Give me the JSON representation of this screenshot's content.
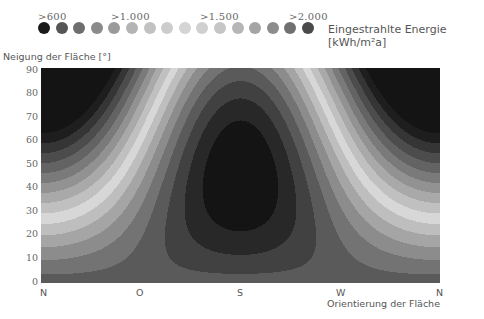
{
  "chart_data": {
    "type": "heatmap",
    "subtype": "filled-contour",
    "title": "",
    "legend": {
      "title": "Eingestrahlte Energie [kWh/m²a]",
      "tick_labels": [
        ">600",
        ">1.000",
        ">1.500",
        ">2.000"
      ],
      "swatch_colors": [
        "#1a1a1a",
        "#555555",
        "#6e6e6e",
        "#8a8a8a",
        "#9a9a9a",
        "#b4b4b4",
        "#c2c2c2",
        "#cccccc",
        "#d4d4d4",
        "#d0d0d0",
        "#c6c6c6",
        "#b6b6b6",
        "#a4a4a4",
        "#8c8c8c",
        "#707070",
        "#4a4a4a"
      ],
      "value_steps": [
        600,
        700,
        800,
        900,
        1000,
        1100,
        1200,
        1300,
        1400,
        1500,
        1600,
        1700,
        1800,
        1900,
        2000,
        2100
      ]
    },
    "xlabel": "Orientierung der Fläche",
    "ylabel": "Neigung der Fläche [°]",
    "x_ticks": [
      "N",
      "O",
      "S",
      "W",
      "N"
    ],
    "x_tick_azimuth_deg": [
      0,
      90,
      180,
      270,
      360
    ],
    "y_ticks": [
      0,
      10,
      20,
      30,
      40,
      50,
      60,
      70,
      80,
      90
    ],
    "ylim": [
      0,
      90
    ],
    "xlim": [
      0,
      360
    ],
    "grid": false,
    "approx_values": [
      {
        "orientation": "N",
        "tilt": 90,
        "value": 600
      },
      {
        "orientation": "N",
        "tilt": 0,
        "value": 1900
      },
      {
        "orientation": "O",
        "tilt": 90,
        "value": 1100
      },
      {
        "orientation": "S",
        "tilt": 90,
        "value": 1400
      },
      {
        "orientation": "S",
        "tilt": 60,
        "value": 1500
      },
      {
        "orientation": "S",
        "tilt": 20,
        "value": 2100
      },
      {
        "orientation": "W",
        "tilt": 90,
        "value": 1100
      },
      {
        "orientation": "N",
        "tilt": 45,
        "value": 1400
      }
    ]
  }
}
